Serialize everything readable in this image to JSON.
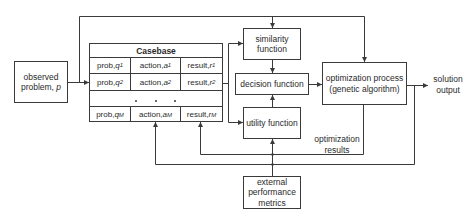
{
  "diagram": {
    "observed_problem": {
      "line1": "observed",
      "line2": "problem, ",
      "symbol": "p"
    },
    "casebase": {
      "title": "Casebase",
      "rows": [
        {
          "prob_label": "prob, ",
          "prob_var": "q",
          "prob_sub": "1",
          "action_label": "action, ",
          "action_var": "a",
          "action_sub": "1",
          "result_label": "result, ",
          "result_var": "r",
          "result_sub": "1"
        },
        {
          "prob_label": "prob, ",
          "prob_var": "q",
          "prob_sub": "2",
          "action_label": "action, ",
          "action_var": "a",
          "action_sub": "2",
          "result_label": "result, ",
          "result_var": "r",
          "result_sub": "2"
        },
        {
          "prob_label": "prob, ",
          "prob_var": "q",
          "prob_sub": "M",
          "action_label": "action, ",
          "action_var": "a",
          "action_sub": "M",
          "result_label": "result, ",
          "result_var": "r",
          "result_sub": "M"
        }
      ],
      "ellipsis": "• • •"
    },
    "similarity_function": {
      "line1": "similarity",
      "line2": "function"
    },
    "decision_function": {
      "label": "decision function"
    },
    "utility_function": {
      "label": "utility function"
    },
    "external_metrics": {
      "line1": "external",
      "line2": "performance",
      "line3": "metrics"
    },
    "optimization_process": {
      "line1": "optimization process",
      "line2": "(genetic algorithm)"
    },
    "solution_output": {
      "line1": "solution",
      "line2": "output"
    },
    "optimization_results": {
      "line1": "optimization",
      "line2": "results"
    }
  },
  "colors": {
    "line": "#3a3a3a",
    "text": "#2a2a2a",
    "background": "#ffffff"
  }
}
